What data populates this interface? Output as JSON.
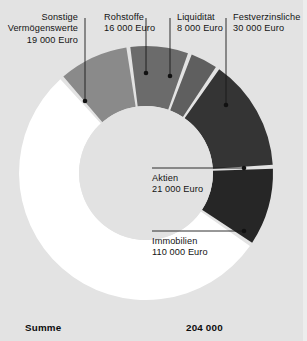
{
  "currency": "Euro",
  "background_color": "#e3e3e3",
  "summary": {
    "label": "Summe",
    "value": "204 000"
  },
  "labels": {
    "sonstige": {
      "name_line1": "Sonstige",
      "name_line2": "Vermögenswerte",
      "value": "19 000 Euro"
    },
    "rohstoffe": {
      "name_line1": "Rohstoffe",
      "value": "16 000 Euro"
    },
    "liquiditaet": {
      "name_line1": "Liquidität",
      "value": "8 000 Euro"
    },
    "festverzinsliche": {
      "name_line1": "Festverzinsliche",
      "value": "30 000 Euro"
    },
    "aktien": {
      "name_line1": "Aktien",
      "value": "21 000 Euro"
    },
    "immobilien": {
      "name_line1": "Immobilien",
      "value": "110 000 Euro"
    }
  },
  "chart_data": {
    "type": "pie",
    "variant": "donut",
    "unit": "Euro",
    "total": 204000,
    "total_label": "204 000",
    "categories": [
      "Sonstige Vermögenswerte",
      "Rohstoffe",
      "Liquidität",
      "Festverzinsliche",
      "Aktien",
      "Immobilien"
    ],
    "values": [
      19000,
      16000,
      8000,
      30000,
      21000,
      110000
    ],
    "value_labels": [
      "19 000 Euro",
      "16 000 Euro",
      "8 000 Euro",
      "30 000 Euro",
      "21 000 Euro",
      "110 000 Euro"
    ],
    "percentages": [
      9.3,
      7.8,
      3.9,
      14.7,
      10.3,
      53.9
    ],
    "colors": [
      "#8a8a8a",
      "#6b6b6b",
      "#5f5f5f",
      "#343434",
      "#262626",
      "#ffffff"
    ],
    "slice_gap_color": "#e3e3e3",
    "hole_color": "#e2e2e2",
    "legend": "callout-labels",
    "grid": false,
    "geometry": {
      "center_x": 146,
      "center_y": 173,
      "outer_radius": 127,
      "inner_radius": 67,
      "start_angle_deg": -41.5,
      "direction": "clockwise"
    },
    "slices": [
      {
        "name": "Sonstige Vermögenswerte",
        "value": 19000,
        "start_deg": -41.5,
        "end_deg": -8.0,
        "color": "#8a8a8a"
      },
      {
        "name": "Rohstoffe",
        "value": 16000,
        "start_deg": -8.0,
        "end_deg": 20.2,
        "color": "#6b6b6b"
      },
      {
        "name": "Liquidität",
        "value": 8000,
        "start_deg": 20.2,
        "end_deg": 34.3,
        "color": "#5f5f5f"
      },
      {
        "name": "Festverzinsliche",
        "value": 30000,
        "start_deg": 34.3,
        "end_deg": 87.2,
        "color": "#343434"
      },
      {
        "name": "Aktien",
        "value": 21000,
        "start_deg": 87.2,
        "end_deg": 124.2,
        "color": "#262626"
      },
      {
        "name": "Immobilien",
        "value": 110000,
        "start_deg": 124.2,
        "end_deg": 318.5,
        "color": "#ffffff"
      }
    ],
    "leader_lines": [
      {
        "name": "Sonstige Vermögenswerte",
        "dot_x": 85,
        "dot_y": 101,
        "line_to_y": 50
      },
      {
        "name": "Rohstoffe",
        "dot_x": 146,
        "dot_y": 73,
        "line_to_y": 50
      },
      {
        "name": "Liquidität",
        "dot_x": 170,
        "dot_y": 76,
        "line_to_y": 50
      },
      {
        "name": "Festverzinsliche",
        "dot_x": 226,
        "dot_y": 105,
        "line_to_y": 50
      },
      {
        "name": "Aktien",
        "dot_x": 244,
        "dot_y": 168,
        "line_to_x": 152
      },
      {
        "name": "Immobilien",
        "dot_x": 244,
        "dot_y": 231,
        "line_to_x": 152
      }
    ]
  }
}
